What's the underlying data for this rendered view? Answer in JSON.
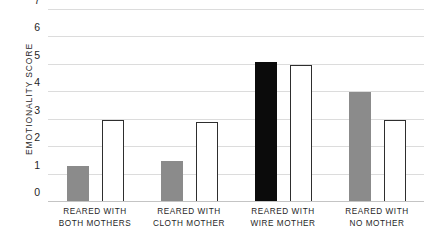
{
  "chart_data": {
    "type": "bar",
    "title": "",
    "xlabel": "",
    "ylabel": "EMOTIONALITY SCORE",
    "ylim": [
      0,
      7
    ],
    "yticks": [
      0,
      1,
      2,
      3,
      4,
      5,
      6,
      7
    ],
    "ytick_labels": [
      "0",
      "1",
      "2",
      "3",
      "4",
      "5",
      "6",
      "7"
    ],
    "grid": true,
    "legend": "none",
    "categories": [
      "REARED WITH BOTH MOTHERS",
      "REARED WITH CLOTH MOTHER",
      "REARED WITH WIRE MOTHER",
      "REARED WITH NO MOTHER"
    ],
    "category_lines": [
      [
        "REARED WITH",
        "BOTH MOTHERS"
      ],
      [
        "REARED WITH",
        "CLOTH MOTHER"
      ],
      [
        "REARED WITH",
        "WIRE MOTHER"
      ],
      [
        "REARED WITH",
        "NO MOTHER"
      ]
    ],
    "series": [
      {
        "name": "filled",
        "values": [
          1.3,
          1.5,
          5.1,
          4.0
        ],
        "fills": [
          "#8b8b8b",
          "#8b8b8b",
          "#0b0b0b",
          "#8b8b8b"
        ],
        "styles": [
          "gray",
          "gray",
          "black",
          "gray"
        ]
      },
      {
        "name": "open",
        "values": [
          3.0,
          2.9,
          5.0,
          3.0
        ],
        "fills": [
          "#ffffff",
          "#ffffff",
          "#ffffff",
          "#ffffff"
        ],
        "styles": [
          "white",
          "white",
          "white",
          "white"
        ]
      }
    ],
    "colors": {
      "gray_bar": "#8b8b8b",
      "black_bar": "#0b0b0b",
      "white_bar_fill": "#ffffff",
      "white_bar_outline": "#2e2e2e",
      "gridline": "#dcdcdc",
      "axis": "#c4c4c4",
      "text": "#1f1f1f"
    }
  }
}
